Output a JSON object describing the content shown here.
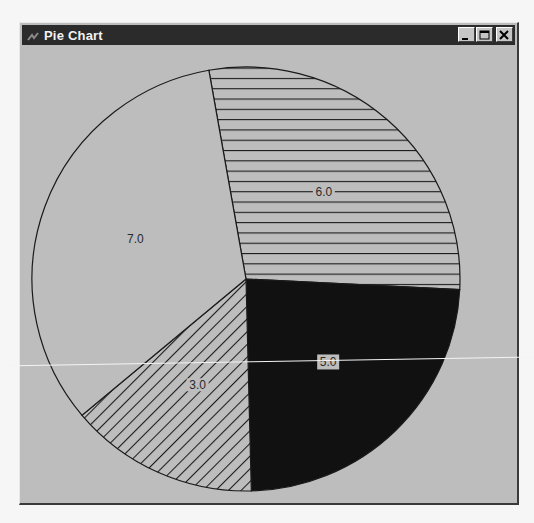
{
  "window": {
    "title": "Pie Chart",
    "buttons": {
      "minimize": "minimize-button",
      "maximize": "maximize-button",
      "close": "close-button"
    }
  },
  "chart_data": {
    "type": "pie",
    "title": "Pie Chart",
    "categories": [
      "6.0",
      "5.0",
      "3.0",
      "7.0"
    ],
    "values": [
      6.0,
      5.0,
      3.0,
      7.0
    ],
    "labels": [
      "6.0",
      "5.0",
      "3.0",
      "7.0"
    ],
    "fill_patterns": [
      "horizontal-hatch",
      "solid-black",
      "diagonal-hatch",
      "none"
    ],
    "start_angle_deg_from_north": -10,
    "direction": "clockwise",
    "legend": "none",
    "grid": false
  },
  "colors": {
    "background": "#bdbdbd",
    "titlebar": "#2b2b2b",
    "outline": "#1a1a1a",
    "solid_fill": "#111111",
    "label_text": "#2a2a2a"
  }
}
